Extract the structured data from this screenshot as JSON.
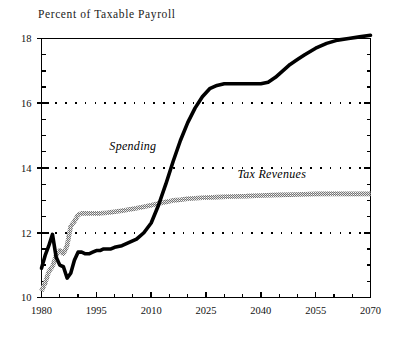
{
  "figure": {
    "title": "Percent of Taxable Payroll",
    "background_color": "#ffffff"
  },
  "chart_data": {
    "type": "line",
    "title": "Percent of Taxable Payroll",
    "xlabel": "",
    "ylabel": "Percent of Taxable Payroll",
    "xlim": [
      1980,
      2070
    ],
    "ylim": [
      10,
      18
    ],
    "xticks": [
      1980,
      1995,
      2010,
      2025,
      2040,
      2055,
      2070
    ],
    "xtick_labels": [
      "1980",
      "1995",
      "2010",
      "2025",
      "2040",
      "2055",
      "2070"
    ],
    "xminor_step": 5,
    "yticks": [
      10,
      12,
      14,
      16,
      18
    ],
    "ytick_labels": [
      "10",
      "12",
      "14",
      "16",
      "18"
    ],
    "yminor_step": 0.5,
    "grid": "horizontal-dotted",
    "legend": "inline-annotations",
    "annotations": [
      {
        "text": "Spending",
        "x": 2005,
        "y": 14.55,
        "style": "italic"
      },
      {
        "text": "Tax Revenues",
        "x": 2043,
        "y": 13.7,
        "style": "italic"
      }
    ],
    "series": [
      {
        "name": "Spending",
        "label": "Spending",
        "color": "#000000",
        "line_style": "solid-thick",
        "x": [
          1980,
          1981,
          1982,
          1983,
          1984,
          1985,
          1986,
          1987,
          1988,
          1989,
          1990,
          1991,
          1992,
          1993,
          1994,
          1995,
          1996,
          1997,
          1998,
          1999,
          2000,
          2002,
          2004,
          2006,
          2008,
          2010,
          2012,
          2014,
          2016,
          2018,
          2020,
          2022,
          2024,
          2026,
          2028,
          2030,
          2032,
          2034,
          2036,
          2038,
          2040,
          2042,
          2044,
          2046,
          2048,
          2050,
          2052,
          2055,
          2058,
          2061,
          2064,
          2067,
          2070
        ],
        "y": [
          10.9,
          11.3,
          11.6,
          11.95,
          11.25,
          11.0,
          10.95,
          10.6,
          10.75,
          11.15,
          11.4,
          11.4,
          11.35,
          11.35,
          11.4,
          11.45,
          11.45,
          11.5,
          11.5,
          11.5,
          11.55,
          11.6,
          11.7,
          11.8,
          12.0,
          12.3,
          12.85,
          13.5,
          14.2,
          14.85,
          15.4,
          15.85,
          16.2,
          16.45,
          16.55,
          16.6,
          16.6,
          16.6,
          16.6,
          16.6,
          16.6,
          16.65,
          16.8,
          17.0,
          17.2,
          17.35,
          17.5,
          17.7,
          17.85,
          17.95,
          18.0,
          18.05,
          18.1
        ]
      },
      {
        "name": "Tax Revenues",
        "label": "Tax Revenues",
        "color": "#8c8c8c",
        "line_style": "stippled-thick",
        "x": [
          1980,
          1981,
          1982,
          1983,
          1984,
          1985,
          1986,
          1987,
          1988,
          1989,
          1990,
          1991,
          1992,
          1993,
          1994,
          1995,
          1996,
          1998,
          2000,
          2002,
          2004,
          2006,
          2008,
          2010,
          2012,
          2014,
          2016,
          2018,
          2020,
          2024,
          2028,
          2032,
          2036,
          2040,
          2045,
          2050,
          2055,
          2060,
          2065,
          2070
        ],
        "y": [
          10.2,
          10.45,
          10.8,
          10.95,
          11.3,
          11.45,
          11.35,
          11.6,
          12.2,
          12.35,
          12.55,
          12.6,
          12.6,
          12.6,
          12.6,
          12.6,
          12.6,
          12.62,
          12.65,
          12.68,
          12.72,
          12.76,
          12.8,
          12.85,
          12.9,
          12.95,
          13.0,
          13.02,
          13.05,
          13.08,
          13.1,
          13.12,
          13.13,
          13.15,
          13.17,
          13.18,
          13.2,
          13.2,
          13.2,
          13.2
        ]
      }
    ]
  },
  "axes": {
    "frame_color": "#000000",
    "tick_color": "#000000",
    "gridline_color": "#000000"
  }
}
